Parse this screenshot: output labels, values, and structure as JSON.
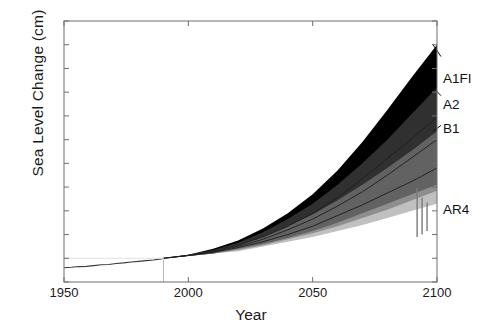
{
  "chart_data": {
    "type": "area",
    "title": "",
    "xlabel": "Year",
    "ylabel": "Sea Level Change (cm)",
    "xlim": [
      1950,
      2100
    ],
    "ylim": [
      -20,
      200
    ],
    "xticks": [
      1950,
      2000,
      2050,
      2100
    ],
    "yticks": [
      -20,
      0,
      20,
      40,
      60,
      80,
      100,
      120,
      140,
      160,
      180,
      200
    ],
    "grid": false,
    "legend_position": "right-inline",
    "baseline_year": 1990,
    "x": [
      1990,
      2000,
      2010,
      2020,
      2030,
      2040,
      2050,
      2060,
      2070,
      2080,
      2090,
      2100
    ],
    "series": [
      {
        "name": "A1FI",
        "label": "A1FI",
        "color": "#000000",
        "upper": [
          0,
          3,
          8,
          15,
          25,
          38,
          54,
          74,
          98,
          125,
          153,
          180
        ],
        "lower": [
          0,
          2,
          4,
          8,
          12,
          17,
          23,
          30,
          38,
          46,
          54,
          62
        ],
        "median": [
          0,
          2.5,
          6,
          11,
          18,
          27,
          38,
          51,
          67,
          84,
          101,
          119
        ]
      },
      {
        "name": "A2",
        "label": "A2",
        "color": "#4d4d4d",
        "upper": [
          0,
          3,
          7,
          13,
          22,
          33,
          46,
          62,
          80,
          100,
          122,
          144
        ],
        "lower": [
          0,
          2,
          4,
          7,
          11,
          16,
          21,
          27,
          34,
          41,
          49,
          57
        ],
        "median": [
          0,
          2.4,
          5.5,
          10,
          16,
          24,
          33,
          44,
          56,
          70,
          85,
          100
        ]
      },
      {
        "name": "B1",
        "label": "B1",
        "color": "#8c8c8c",
        "upper": [
          0,
          3,
          6,
          11,
          18,
          27,
          37,
          49,
          62,
          76,
          91,
          107
        ],
        "lower": [
          0,
          2,
          4,
          6,
          10,
          14,
          18,
          23,
          28,
          34,
          40,
          46
        ],
        "median": [
          0,
          2.3,
          5,
          9,
          14,
          20,
          27,
          36,
          45,
          55,
          65,
          76
        ]
      }
    ],
    "observations": {
      "name": "Observed (tide gauge)",
      "color": "#3a3a3a",
      "x": [
        1950,
        1953,
        1956,
        1959,
        1962,
        1965,
        1968,
        1971,
        1974,
        1977,
        1980,
        1983,
        1986,
        1989,
        1990
      ],
      "y": [
        -8.0,
        -7.6,
        -7.0,
        -6.8,
        -6.2,
        -5.5,
        -5.2,
        -4.4,
        -3.9,
        -3.2,
        -2.6,
        -2.0,
        -1.4,
        -0.5,
        0.0
      ]
    },
    "ar4_markers": {
      "label": "AR4",
      "color": "#7a7a7a",
      "bars": [
        {
          "x": 2092,
          "low": 18,
          "high": 59
        },
        {
          "x": 2094,
          "low": 20,
          "high": 51
        },
        {
          "x": 2096,
          "low": 23,
          "high": 47
        }
      ]
    },
    "annotations": [
      {
        "text": "A1FI",
        "x": 2100,
        "y": 170
      },
      {
        "text": "A2",
        "x": 2100,
        "y": 137
      },
      {
        "text": "B1",
        "x": 2100,
        "y": 112
      },
      {
        "text": "AR4",
        "x": 2100,
        "y": 40
      }
    ]
  },
  "axes": {
    "ylabel": "Sea Level Change (cm)",
    "xlabel": "Year",
    "yticks": [
      "200",
      "180",
      "160",
      "140",
      "120",
      "100",
      "80",
      "60",
      "40",
      "20",
      "0",
      "-20"
    ],
    "xticks": [
      "1950",
      "2000",
      "2050",
      "2100"
    ]
  },
  "legend": {
    "a1fi": "A1FI",
    "a2": "A2",
    "b1": "B1",
    "ar4": "AR4"
  },
  "colors": {
    "a1fi": "#000000",
    "a2": "#4d4d4d",
    "b1": "#8c8c8c",
    "observed": "#3a3a3a",
    "ar4": "#7a7a7a",
    "axis": "#6e6e6e",
    "text": "#1a1a1a"
  }
}
